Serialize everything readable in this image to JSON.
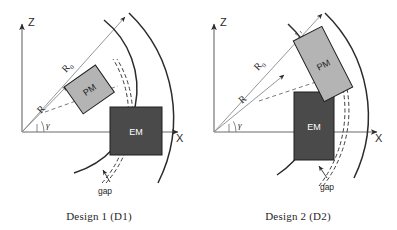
{
  "figure": {
    "background": "#ffffff",
    "stroke_color": "#3a3a3a",
    "axis_color": "#555555"
  },
  "panels": [
    {
      "id": "d1",
      "caption": "Design 1 (D1)",
      "axes": {
        "vertical_label": "Z",
        "horizontal_label": "X"
      },
      "angle_label": "γ",
      "radius_labels": [
        {
          "name": "outer-radius",
          "base": "R",
          "sub": "0"
        },
        {
          "name": "inner-radius",
          "base": "R",
          "sub": ""
        }
      ],
      "blocks": [
        {
          "name": "pm",
          "label": "PM",
          "fill": "#b4b4b4",
          "role": "permanent-magnet"
        },
        {
          "name": "em",
          "label": "EM",
          "fill": "#4a4a4a",
          "role": "electromagnet"
        }
      ],
      "gap": {
        "label": "gap"
      }
    },
    {
      "id": "d2",
      "caption": "Design 2 (D2)",
      "axes": {
        "vertical_label": "Z",
        "horizontal_label": "X"
      },
      "angle_label": "γ",
      "radius_labels": [
        {
          "name": "outer-radius",
          "base": "R",
          "sub": "0"
        },
        {
          "name": "inner-radius",
          "base": "R",
          "sub": ""
        }
      ],
      "blocks": [
        {
          "name": "pm",
          "label": "PM",
          "fill": "#b4b4b4",
          "role": "permanent-magnet"
        },
        {
          "name": "em",
          "label": "EM",
          "fill": "#4a4a4a",
          "role": "electromagnet"
        }
      ],
      "gap": {
        "label": "gap"
      }
    }
  ]
}
